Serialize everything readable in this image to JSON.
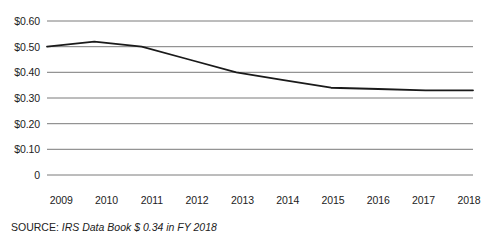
{
  "chart_data": {
    "type": "line",
    "title": "",
    "subtitle": "",
    "xlabel": "",
    "ylabel": "",
    "categories": [
      "2009",
      "2010",
      "2011",
      "2012",
      "2013",
      "2014",
      "2015",
      "2016",
      "2017",
      "2018"
    ],
    "x": [
      2009,
      2010,
      2011,
      2012,
      2013,
      2014,
      2015,
      2016,
      2017,
      2018
    ],
    "values": [
      0.5,
      0.52,
      0.5,
      0.45,
      0.4,
      0.37,
      0.34,
      0.335,
      0.33,
      0.33
    ],
    "series": [
      {
        "name": "Cost of collecting $100",
        "values": [
          0.5,
          0.52,
          0.5,
          0.45,
          0.4,
          0.37,
          0.34,
          0.335,
          0.33,
          0.33
        ],
        "color": "#1a1a1a"
      }
    ],
    "ylim": [
      0,
      0.6
    ],
    "ytick_values": [
      0.6,
      0.5,
      0.4,
      0.3,
      0.2,
      0.1,
      0
    ],
    "ytick_labels": [
      "$0.60",
      "$0.50",
      "$0.40",
      "$0.30",
      "$0.20",
      "$0.10",
      "0"
    ],
    "xtick_labels": [
      "2009",
      "2010",
      "2011",
      "2012",
      "2013",
      "2014",
      "2015",
      "2016",
      "2017",
      "2018"
    ],
    "grid": true,
    "grid_axis": "y",
    "grid_color": "#7a7a7a",
    "legend": false,
    "legend_position": "none",
    "annotations": []
  },
  "source": {
    "label": "SOURCE:",
    "text": "IRS Data Book $ 0.34 in FY 2018"
  }
}
